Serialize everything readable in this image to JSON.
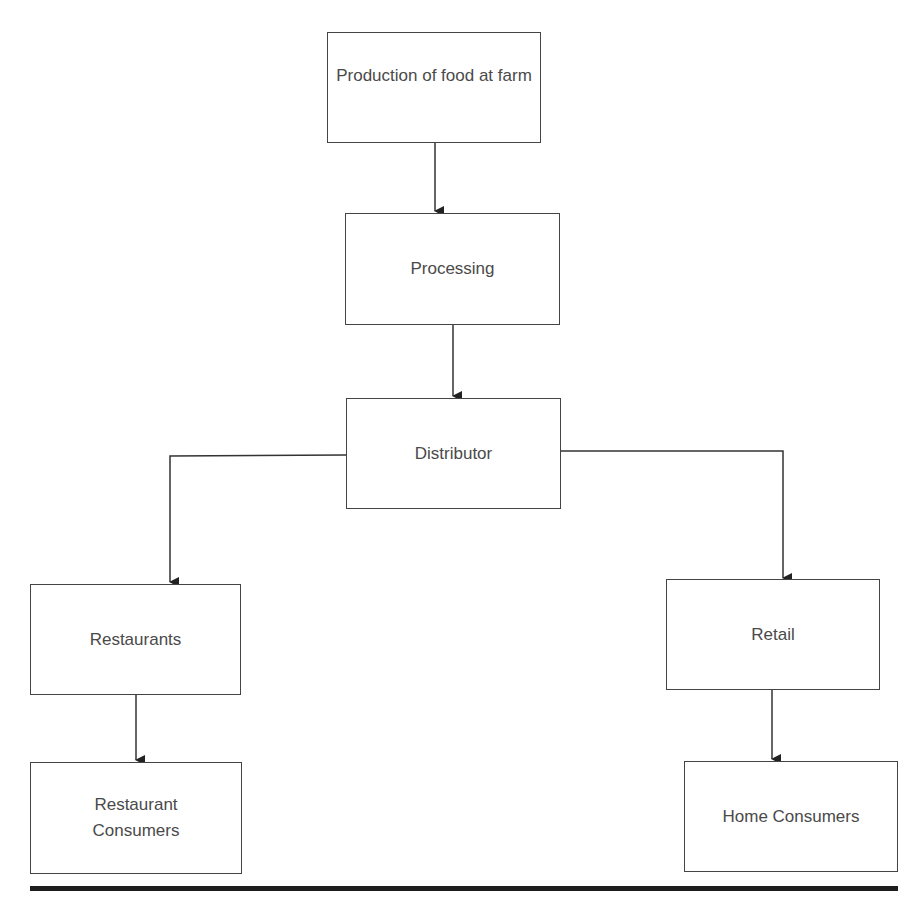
{
  "diagram": {
    "nodes": [
      {
        "id": "farm",
        "label": "Production of food at farm"
      },
      {
        "id": "processing",
        "label": "Processing"
      },
      {
        "id": "distributor",
        "label": "Distributor"
      },
      {
        "id": "restaurants",
        "label": "Restaurants"
      },
      {
        "id": "retail",
        "label": "Retail"
      },
      {
        "id": "restaurant_consumers",
        "label": "Restaurant Consumers"
      },
      {
        "id": "home_consumers",
        "label": "Home Consumers"
      }
    ],
    "edges": [
      {
        "from": "farm",
        "to": "processing"
      },
      {
        "from": "processing",
        "to": "distributor"
      },
      {
        "from": "distributor",
        "to": "restaurants"
      },
      {
        "from": "distributor",
        "to": "retail"
      },
      {
        "from": "restaurants",
        "to": "restaurant_consumers"
      },
      {
        "from": "retail",
        "to": "home_consumers"
      }
    ],
    "colors": {
      "stroke": "#444444",
      "text": "#4a4a4a",
      "rule": "#1e1e1e"
    }
  }
}
